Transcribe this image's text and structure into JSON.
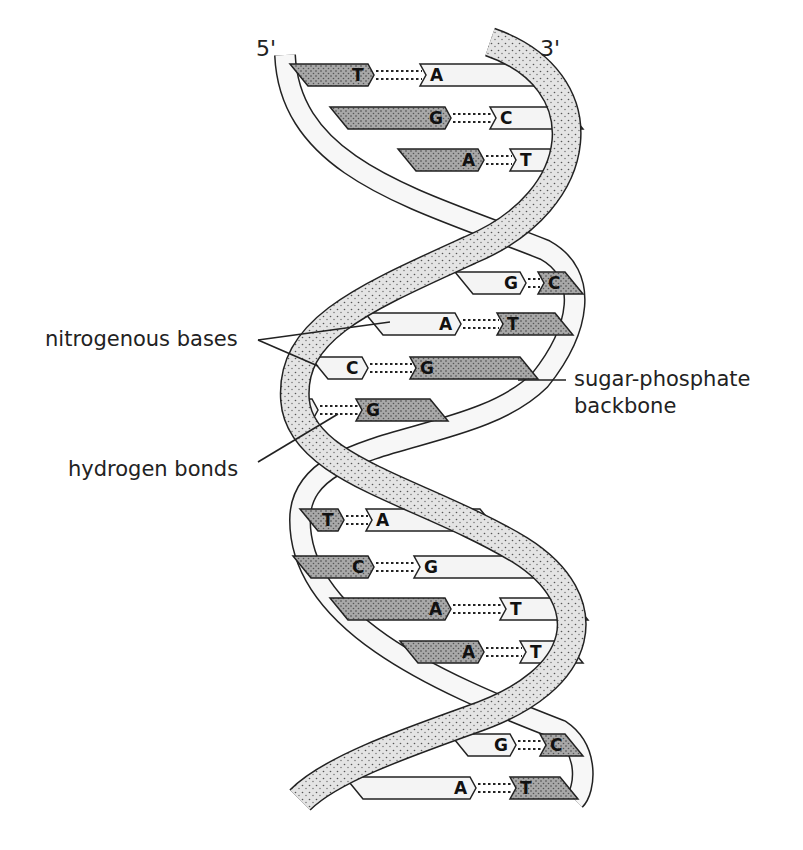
{
  "diagram": {
    "strand_ends": {
      "left": "5'",
      "right": "3'"
    },
    "labels": {
      "nitrogenous_bases": "nitrogenous bases",
      "sugar_phosphate_line1": "sugar-phosphate",
      "sugar_phosphate_line2": "backbone",
      "hydrogen_bonds": "hydrogen bonds"
    },
    "colors": {
      "ink": "#222222",
      "dark_base": "#9a9a9a",
      "light_base": "#f4f4f4",
      "backbone_stipple": "#d6d6d6",
      "backbone_light": "#f7f7f7"
    },
    "base_pairs": [
      {
        "left": "T",
        "right": "A",
        "y": 75,
        "lx": 290,
        "ljoin": 368,
        "rjoin": 420,
        "rx": 540,
        "left_dark": true
      },
      {
        "left": "G",
        "right": "C",
        "y": 118,
        "lx": 330,
        "ljoin": 445,
        "rjoin": 490,
        "rx": 565,
        "left_dark": true
      },
      {
        "left": "A",
        "right": "T",
        "y": 160,
        "lx": 398,
        "ljoin": 478,
        "rjoin": 510,
        "rx": 550,
        "left_dark": true
      },
      {
        "left": "G",
        "right": "C",
        "y": 283,
        "lx": 455,
        "ljoin": 520,
        "rjoin": 538,
        "rx": 565,
        "left_dark": false
      },
      {
        "left": "A",
        "right": "T",
        "y": 324,
        "lx": 365,
        "ljoin": 455,
        "rjoin": 497,
        "rx": 555,
        "left_dark": false
      },
      {
        "left": "C",
        "right": "G",
        "y": 368,
        "lx": 310,
        "ljoin": 362,
        "rjoin": 410,
        "rx": 520,
        "left_dark": false
      },
      {
        "left": "C",
        "right": "G",
        "y": 410,
        "lx": 290,
        "ljoin": 312,
        "rjoin": 356,
        "rx": 430,
        "left_dark": false
      },
      {
        "left": "T",
        "right": "A",
        "y": 520,
        "lx": 300,
        "ljoin": 338,
        "rjoin": 366,
        "rx": 480,
        "left_dark": true
      },
      {
        "left": "C",
        "right": "G",
        "y": 567,
        "lx": 293,
        "ljoin": 368,
        "rjoin": 414,
        "rx": 545,
        "left_dark": true
      },
      {
        "left": "A",
        "right": "T",
        "y": 609,
        "lx": 330,
        "ljoin": 445,
        "rjoin": 500,
        "rx": 570,
        "left_dark": true
      },
      {
        "left": "A",
        "right": "T",
        "y": 652,
        "lx": 400,
        "ljoin": 478,
        "rjoin": 520,
        "rx": 565,
        "left_dark": true
      },
      {
        "left": "G",
        "right": "C",
        "y": 745,
        "lx": 450,
        "ljoin": 510,
        "rjoin": 540,
        "rx": 565,
        "left_dark": false
      },
      {
        "left": "A",
        "right": "T",
        "y": 788,
        "lx": 345,
        "ljoin": 470,
        "rjoin": 510,
        "rx": 560,
        "left_dark": false
      }
    ]
  }
}
